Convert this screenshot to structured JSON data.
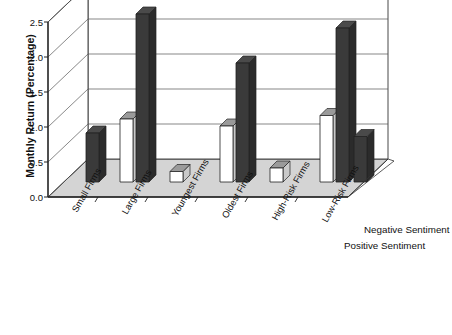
{
  "chart_data": {
    "type": "bar",
    "title": "",
    "subtitle": "",
    "xlabel": "",
    "ylabel": "Monthly Return (Percentage)",
    "ylim": [
      0.0,
      2.5
    ],
    "ytick_labels": [
      "0.0",
      "0.5",
      "1.0",
      "1.5",
      "2.0",
      "2.5"
    ],
    "ytick_values": [
      0.0,
      0.5,
      1.0,
      1.5,
      2.0,
      2.5
    ],
    "grid": true,
    "grid_axis": "y",
    "legend_position": "right-bottom",
    "three_d": true,
    "categories": [
      "Small Firms",
      "Large Firms",
      "Youngest Firms",
      "Oldest Firms",
      "High-Risk Firms",
      "Low-Risk Firms"
    ],
    "series": [
      {
        "name": "Positive Sentiment",
        "color": "#ffffff",
        "values": [
          0.0,
          0.9,
          0.15,
          0.8,
          0.2,
          0.95
        ]
      },
      {
        "name": "Negative Sentiment",
        "color": "#3a3a3a",
        "values": [
          0.7,
          2.4,
          0.0,
          1.7,
          0.0,
          2.2
        ]
      }
    ],
    "extra_series": [
      {
        "name": "Low-Risk Firms trailing bar",
        "color": "#3a3a3a",
        "category": "Low-Risk Firms",
        "value": 0.65
      }
    ]
  },
  "legend": {
    "entries": [
      {
        "label": "Negative Sentiment"
      },
      {
        "label": "Positive Sentiment"
      }
    ]
  },
  "colors": {
    "bar_positive_face": "#ffffff",
    "bar_negative_face": "#3a3a3a",
    "bar_side_light": "#c9c9c9",
    "bar_top_dark": "#4a4a4a",
    "floor": "#d4d4d4",
    "axis": "#222222",
    "grid": "#555555"
  }
}
